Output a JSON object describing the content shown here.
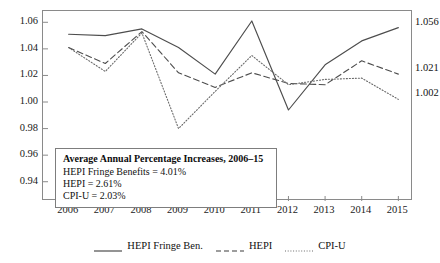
{
  "chart_data": {
    "type": "line",
    "title": "",
    "xlabel": "",
    "ylabel": "",
    "grid": false,
    "legend_position": "bottom",
    "x": [
      2006,
      2007,
      2008,
      2009,
      2010,
      2011,
      2012,
      2013,
      2014,
      2015
    ],
    "categories": [
      "2006",
      "2007",
      "2008",
      "2009",
      "2010",
      "2011",
      "2012",
      "2013",
      "2014",
      "2015"
    ],
    "xlim": [
      2005.3,
      2015.4
    ],
    "ylim": [
      0.9255,
      1.0685
    ],
    "yticks": [
      0.94,
      0.96,
      0.98,
      1.0,
      1.02,
      1.04,
      1.06
    ],
    "ytick_labels": [
      "0.94",
      "0.96",
      "0.98",
      "1.00",
      "1.02",
      "1.04",
      "1.06"
    ],
    "series": [
      {
        "name": "HEPI Fringe Ben.",
        "style": "solid",
        "color": "#4d4d4d",
        "values": [
          1.051,
          1.05,
          1.055,
          1.041,
          1.021,
          1.061,
          0.994,
          1.028,
          1.046,
          1.056
        ],
        "end_label": "1.056"
      },
      {
        "name": "HEPI",
        "style": "dashed",
        "color": "#4d4d4d",
        "values": [
          1.041,
          1.029,
          1.053,
          1.022,
          1.011,
          1.022,
          1.014,
          1.013,
          1.031,
          1.021
        ],
        "end_label": "1.021"
      },
      {
        "name": "CPI-U",
        "style": "dotted",
        "color": "#6b6b6b",
        "values": [
          1.041,
          1.023,
          1.052,
          0.98,
          1.008,
          1.035,
          1.013,
          1.017,
          1.018,
          1.002
        ],
        "end_label": "1.002"
      }
    ],
    "annotations": {
      "box": {
        "title": "Average Annual Percentage Increases, 2006–15",
        "lines": [
          "HEPI Fringe Benefits = 4.01%",
          "HEPI = 2.61%",
          "CPI-U = 2.03%"
        ]
      }
    }
  },
  "legend": {
    "entries": [
      {
        "label": "HEPI Fringe Ben.",
        "style": "solid"
      },
      {
        "label": "HEPI",
        "style": "dashed"
      },
      {
        "label": "CPI-U",
        "style": "dotted"
      }
    ]
  },
  "colors": {
    "frame": "#8a8a8a",
    "text": "#111111",
    "background": "#ffffff"
  }
}
